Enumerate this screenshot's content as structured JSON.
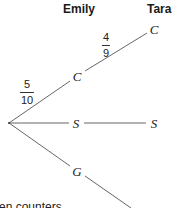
{
  "headers": {
    "emily": "Emily",
    "tara": "Tara"
  },
  "nodes": {
    "root": {
      "x": 9,
      "y": 123
    },
    "emily_c": {
      "label": "C",
      "x": 77,
      "y": 76
    },
    "emily_s": {
      "label": "S",
      "x": 76,
      "y": 123
    },
    "emily_g": {
      "label": "G",
      "x": 77,
      "y": 171
    },
    "tara_c": {
      "label": "C",
      "x": 154,
      "y": 29
    },
    "tara_s": {
      "label": "S",
      "x": 154,
      "y": 123
    }
  },
  "probabilities": {
    "root_to_c": {
      "numerator": "5",
      "denominator": "10"
    },
    "c_to_c": {
      "numerator": "4",
      "denominator": "9"
    }
  },
  "caption": "en counters",
  "colors": {
    "line": "#555555",
    "text": "#222222"
  }
}
